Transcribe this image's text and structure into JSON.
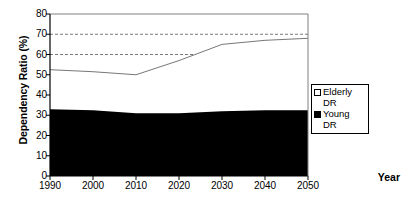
{
  "chart_data": {
    "type": "area",
    "title": "",
    "subtitle": "",
    "xlabel": "Year",
    "ylabel": "Dependency Ratio (%)",
    "x": [
      1990,
      2000,
      2010,
      2020,
      2030,
      2040,
      2050
    ],
    "xtick_labels": [
      "1990",
      "2000",
      "2010",
      "2020",
      "2030",
      "2040",
      "2050"
    ],
    "ytick_labels": [
      "0",
      "10",
      "20",
      "30",
      "40",
      "50",
      "60",
      "70",
      "80"
    ],
    "ytick_values": [
      0,
      10,
      20,
      30,
      40,
      50,
      60,
      70,
      80
    ],
    "ylim": [
      0,
      80
    ],
    "xlim": [
      1990,
      2050
    ],
    "stacked": true,
    "grid": "horizontal-dashed-at-60-and-70",
    "gridlines": [
      60,
      70
    ],
    "legend_position": "right",
    "series": [
      {
        "name": "Young DR",
        "color": "#000000",
        "values": [
          33.0,
          32.5,
          31.0,
          31.0,
          32.0,
          32.5,
          32.5
        ]
      },
      {
        "name": "Elderly DR",
        "color": "#ffffff",
        "values": [
          19.5,
          19.0,
          19.0,
          26.0,
          33.0,
          34.5,
          35.5
        ]
      }
    ],
    "total_values": [
      52.5,
      51.5,
      50.0,
      57.0,
      65.0,
      67.0,
      68.0
    ]
  },
  "legend": {
    "items": [
      {
        "label": "Elderly\nDR",
        "swatch": "open-square"
      },
      {
        "label": "Young\nDR",
        "swatch": "solid-square"
      }
    ]
  },
  "axes": {
    "y_title": "Dependency Ratio (%)",
    "x_title": "Year"
  }
}
